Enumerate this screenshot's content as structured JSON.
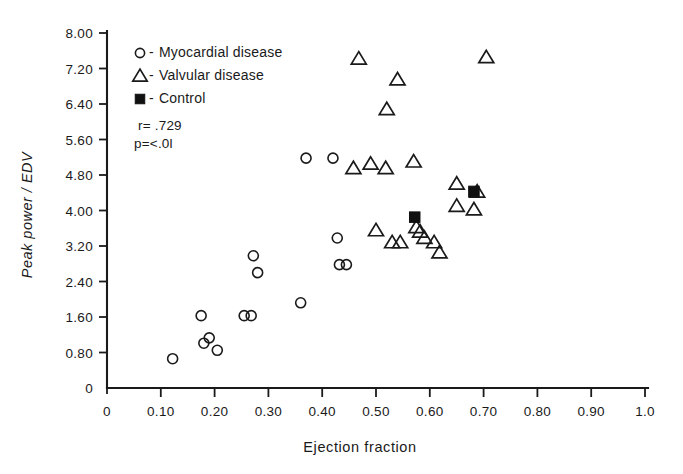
{
  "chart_data": {
    "type": "scatter",
    "title": "",
    "xlabel": "Ejection fraction",
    "ylabel": "Peak power / EDV",
    "xlim": [
      0,
      1.0
    ],
    "ylim": [
      0,
      8.0
    ],
    "grid": false,
    "x_ticks": [
      "0",
      "0.10",
      "0.20",
      "0.30",
      "0.40",
      "0.50",
      "0.60",
      "0.70",
      "0.80",
      "0.90",
      "1.0"
    ],
    "x_tick_values": [
      0,
      0.1,
      0.2,
      0.3,
      0.4,
      0.5,
      0.6,
      0.7,
      0.8,
      0.9,
      1.0
    ],
    "y_ticks": [
      "0",
      "0.80",
      "1.60",
      "2.40",
      "3.20",
      "4.00",
      "4.80",
      "5.60",
      "6.40",
      "7.20",
      "8.00"
    ],
    "y_tick_values": [
      0,
      0.8,
      1.6,
      2.4,
      3.2,
      4.0,
      4.8,
      5.6,
      6.4,
      7.2,
      8.0
    ],
    "legend_position": "upper-left-inside",
    "annotations": [
      "r= .729",
      "p=<.0l"
    ],
    "series": [
      {
        "name": "Myocardial disease",
        "marker": "open-circle",
        "points": [
          [
            0.122,
            0.66
          ],
          [
            0.175,
            1.63
          ],
          [
            0.18,
            1.01
          ],
          [
            0.19,
            1.13
          ],
          [
            0.205,
            0.85
          ],
          [
            0.255,
            1.63
          ],
          [
            0.268,
            1.63
          ],
          [
            0.272,
            2.98
          ],
          [
            0.28,
            2.6
          ],
          [
            0.36,
            1.92
          ],
          [
            0.42,
            5.18
          ],
          [
            0.428,
            3.38
          ],
          [
            0.432,
            2.78
          ],
          [
            0.445,
            2.78
          ],
          [
            0.37,
            5.18
          ]
        ]
      },
      {
        "name": "Valvular disease",
        "marker": "open-triangle",
        "points": [
          [
            0.468,
            7.42
          ],
          [
            0.54,
            6.95
          ],
          [
            0.705,
            7.45
          ],
          [
            0.52,
            6.28
          ],
          [
            0.458,
            4.95
          ],
          [
            0.49,
            5.05
          ],
          [
            0.518,
            4.95
          ],
          [
            0.57,
            5.1
          ],
          [
            0.65,
            4.6
          ],
          [
            0.688,
            4.42
          ],
          [
            0.65,
            4.1
          ],
          [
            0.682,
            4.02
          ],
          [
            0.5,
            3.55
          ],
          [
            0.53,
            3.28
          ],
          [
            0.545,
            3.28
          ],
          [
            0.575,
            3.62
          ],
          [
            0.582,
            3.52
          ],
          [
            0.59,
            3.38
          ],
          [
            0.608,
            3.28
          ],
          [
            0.618,
            3.05
          ]
        ]
      },
      {
        "name": "Control",
        "marker": "filled-square",
        "points": [
          [
            0.572,
            3.85
          ],
          [
            0.682,
            4.43
          ]
        ]
      }
    ]
  },
  "legend": {
    "items": [
      {
        "marker": "open-circle",
        "dash": "-",
        "label": "Myocardial disease"
      },
      {
        "marker": "open-triangle",
        "dash": "-",
        "label": "Valvular disease"
      },
      {
        "marker": "filled-square",
        "dash": "-",
        "label": "Control"
      }
    ]
  },
  "stats": {
    "correlation": "r= .729",
    "pvalue": "p=<.0l"
  },
  "colors": {
    "ink": "#1a1a1a",
    "background": "#ffffff",
    "marker_fill": "#101010"
  }
}
